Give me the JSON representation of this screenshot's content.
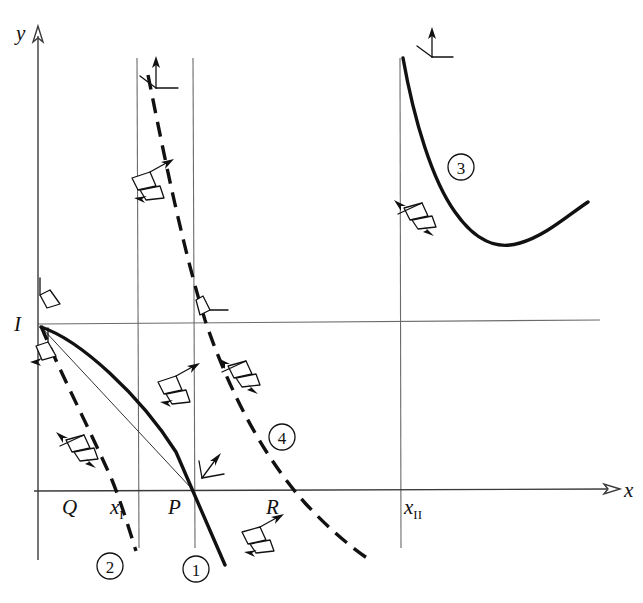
{
  "figure": {
    "kind": "phase-plane-diagram",
    "background": "#ffffff",
    "ink": "#111111",
    "grid_color": "#6b6b6b",
    "width": 643,
    "height": 603
  },
  "axes": {
    "x_label": "x",
    "y_label": "y",
    "x_axis": {
      "y": 490,
      "x_start": 36,
      "x_end": 624
    },
    "y_axis": {
      "x": 38,
      "y_top": 30,
      "y_bottom": 560
    }
  },
  "gridlines": [
    {
      "name": "vertical-line-xI",
      "x": 137,
      "y1": 58,
      "y2": 548
    },
    {
      "name": "vertical-line-P",
      "x": 193,
      "y1": 58,
      "y2": 548
    },
    {
      "name": "vertical-line-xII",
      "x": 400,
      "y1": 58,
      "y2": 548
    },
    {
      "name": "horizontal-line-I",
      "y": 323,
      "x1": 38,
      "x2": 600
    }
  ],
  "point_labels": [
    {
      "name": "label-I",
      "text": "I",
      "x": 16,
      "y": 331,
      "sub": ""
    },
    {
      "name": "label-Q",
      "text": "Q",
      "x": 63,
      "y": 513,
      "sub": ""
    },
    {
      "name": "label-xI",
      "text": "x",
      "x": 112,
      "y": 513,
      "sub": "I"
    },
    {
      "name": "label-P",
      "text": "P",
      "x": 170,
      "y": 513,
      "sub": ""
    },
    {
      "name": "label-R",
      "text": "R",
      "x": 268,
      "y": 513,
      "sub": ""
    },
    {
      "name": "label-xII",
      "text": "x",
      "x": 404,
      "y": 513,
      "sub": "II"
    }
  ],
  "curves": [
    {
      "id": "1",
      "name": "curve-1",
      "style": "solid",
      "description": "thick solid arc from I bulging upward then steeply down through P and below",
      "circle_label": {
        "text": "1",
        "cx": 196,
        "cy": 569
      }
    },
    {
      "id": "2",
      "name": "curve-2",
      "style": "dashed",
      "description": "dashed curve from I descending steeply left of x_I down past Q",
      "circle_label": {
        "text": "2",
        "cx": 110,
        "cy": 566
      }
    },
    {
      "id": "3",
      "name": "curve-3",
      "style": "solid",
      "description": "thick solid convex curve in upper right with a minimum",
      "circle_label": {
        "text": "3",
        "cx": 461,
        "cy": 167
      }
    },
    {
      "id": "4",
      "name": "curve-4",
      "style": "dashed",
      "description": "long dashed convex-decreasing curve from top, crossing horizontal-I line and x-axis near R",
      "circle_label": {
        "text": "4",
        "cx": 282,
        "cy": 437
      }
    },
    {
      "id": "chord",
      "name": "chord-I-to-P",
      "style": "thin-solid",
      "description": "thin straight chord from I to P"
    }
  ],
  "markers": [
    {
      "name": "direction-marker-trident",
      "x": 156,
      "y": 72,
      "type": "trident"
    },
    {
      "name": "direction-marker-trident",
      "x": 432,
      "y": 42,
      "type": "trident"
    },
    {
      "name": "direction-marker-trident",
      "x": 202,
      "y": 462,
      "type": "trident"
    },
    {
      "name": "direction-marker-flag",
      "x": 203,
      "y": 310,
      "type": "flag"
    },
    {
      "name": "direction-marker-flag",
      "x": 46,
      "y": 298,
      "type": "flag-up"
    },
    {
      "name": "direction-marker-flag",
      "x": 42,
      "y": 352,
      "type": "flag-down"
    },
    {
      "name": "direction-marker-bird",
      "x": 172,
      "y": 383,
      "type": "bird"
    },
    {
      "name": "direction-marker-bird",
      "x": 152,
      "y": 385,
      "type": "bird"
    },
    {
      "name": "direction-marker-bird",
      "x": 80,
      "y": 447,
      "type": "bird"
    },
    {
      "name": "direction-marker-bird",
      "x": 238,
      "y": 371,
      "type": "bird"
    },
    {
      "name": "direction-marker-bird",
      "x": 232,
      "y": 540,
      "type": "bird"
    },
    {
      "name": "direction-marker-bird",
      "x": 415,
      "y": 214,
      "type": "bird"
    },
    {
      "name": "direction-marker-bird",
      "x": 143,
      "y": 184,
      "type": "bird"
    }
  ]
}
